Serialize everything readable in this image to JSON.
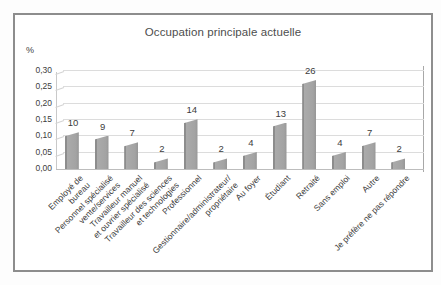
{
  "chart_data": {
    "type": "bar",
    "title": "Occupation principale actuelle",
    "ylabel": "%",
    "xlabel": "",
    "ylim": [
      0,
      0.3
    ],
    "grid": true,
    "legend": "none",
    "bar_style": "3d-gray-column",
    "ytick_labels": [
      "0,30",
      "0,25",
      "0,20",
      "0,15",
      "0,10",
      "0,05",
      "0,00"
    ],
    "ytick_values": [
      0.3,
      0.25,
      0.2,
      0.15,
      0.1,
      0.05,
      0.0
    ],
    "categories": [
      "Employé de bureau",
      "Personnel spécialisé vente/services",
      "Travailleur manuel et ouvrier spécialisé",
      "Travailleur des sciences et technologies",
      "Professionnel",
      "Gestionnaire/administrateur/propriétaire",
      "Au foyer",
      "Étudiant",
      "Retraité",
      "Sans emploi",
      "Autre",
      "Je préfère ne pas répondre"
    ],
    "category_lines": [
      [
        "Employé de",
        "bureau"
      ],
      [
        "Personnel spécialisé",
        "vente/services"
      ],
      [
        "Travailleur manuel",
        "et ouvrier spécialisé"
      ],
      [
        "Travailleur des sciences",
        "et technologies"
      ],
      [
        "Professionnel"
      ],
      [
        "Gestionnaire/administrateur/",
        "propriétaire"
      ],
      [
        "Au foyer"
      ],
      [
        "Étudiant"
      ],
      [
        "Retraité"
      ],
      [
        "Sans emploi"
      ],
      [
        "Autre"
      ],
      [
        "Je préfère ne pas répondre"
      ]
    ],
    "values": [
      0.1,
      0.09,
      0.07,
      0.02,
      0.14,
      0.02,
      0.04,
      0.13,
      0.26,
      0.04,
      0.07,
      0.02
    ],
    "bar_labels": [
      "10",
      "9",
      "7",
      "2",
      "14",
      "2",
      "4",
      "13",
      "26",
      "4",
      "7",
      "2"
    ],
    "colors": {
      "bar_fill": "#a3a3a3",
      "bar_edge_dark": "#8d8d8d",
      "gridline": "#dcdcdc",
      "axis": "#bdbdbd",
      "text": "#3d3d3d",
      "frame_border": "#8d8d8d"
    }
  }
}
